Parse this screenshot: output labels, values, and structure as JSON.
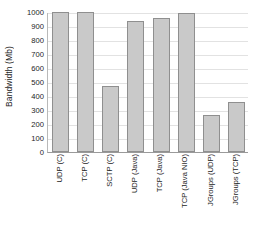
{
  "chart_data": {
    "type": "bar",
    "title": "",
    "xlabel": "",
    "ylabel": "Bandwidth (Mb)",
    "ylim": [
      0,
      1000
    ],
    "yticks": [
      0,
      100,
      200,
      300,
      400,
      500,
      600,
      700,
      800,
      900,
      1000
    ],
    "ytick_labels": [
      "0",
      "100",
      "200",
      "300",
      "400",
      "500",
      "600",
      "700",
      "800",
      "900",
      "1000"
    ],
    "grid": true,
    "legend": "none",
    "bar_color": "#c9c9c9",
    "bar_border_color": "#8f8f8f",
    "categories": [
      "UDP (C)",
      "TCP (C)",
      "SCTP (C)",
      "UDP (Java)",
      "TCP (Java)",
      "TCP (Java NIO)",
      "JGroups (UDP)",
      "JGroups (TCP)"
    ],
    "values": [
      1000,
      1000,
      470,
      935,
      955,
      990,
      265,
      355
    ]
  }
}
